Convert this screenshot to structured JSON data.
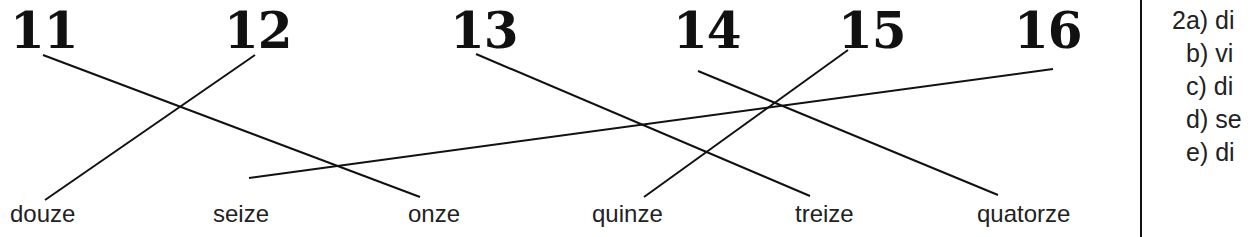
{
  "numbers": [
    {
      "label": "11",
      "x": 10
    },
    {
      "label": "12",
      "x": 224
    },
    {
      "label": "13",
      "x": 450
    },
    {
      "label": "14",
      "x": 673
    },
    {
      "label": "15",
      "x": 838
    },
    {
      "label": "16",
      "x": 1014
    }
  ],
  "words": [
    {
      "label": "douze",
      "x": 10
    },
    {
      "label": "seize",
      "x": 213
    },
    {
      "label": "onze",
      "x": 408
    },
    {
      "label": "quinze",
      "x": 592
    },
    {
      "label": "treize",
      "x": 795
    },
    {
      "label": "quatorze",
      "x": 977
    }
  ],
  "lines": [
    {
      "from": "11",
      "to": "onze",
      "x1": 43,
      "y1": 55,
      "x2": 420,
      "y2": 197
    },
    {
      "from": "12",
      "to": "douze",
      "x1": 255,
      "y1": 55,
      "x2": 45,
      "y2": 200
    },
    {
      "from": "13",
      "to": "treize",
      "x1": 476,
      "y1": 54,
      "x2": 810,
      "y2": 196
    },
    {
      "from": "14",
      "to": "quatorze",
      "x1": 698,
      "y1": 71,
      "x2": 998,
      "y2": 195
    },
    {
      "from": "15",
      "to": "quinze",
      "x1": 848,
      "y1": 50,
      "x2": 644,
      "y2": 197
    },
    {
      "from": "16",
      "to": "seize",
      "x1": 1053,
      "y1": 69,
      "x2": 249,
      "y2": 178
    }
  ],
  "answers": [
    "2a) di",
    " b) vi",
    " c) di",
    " d) se",
    " e) di"
  ],
  "colors": {
    "ink": "#111111",
    "background": "#ffffff"
  }
}
